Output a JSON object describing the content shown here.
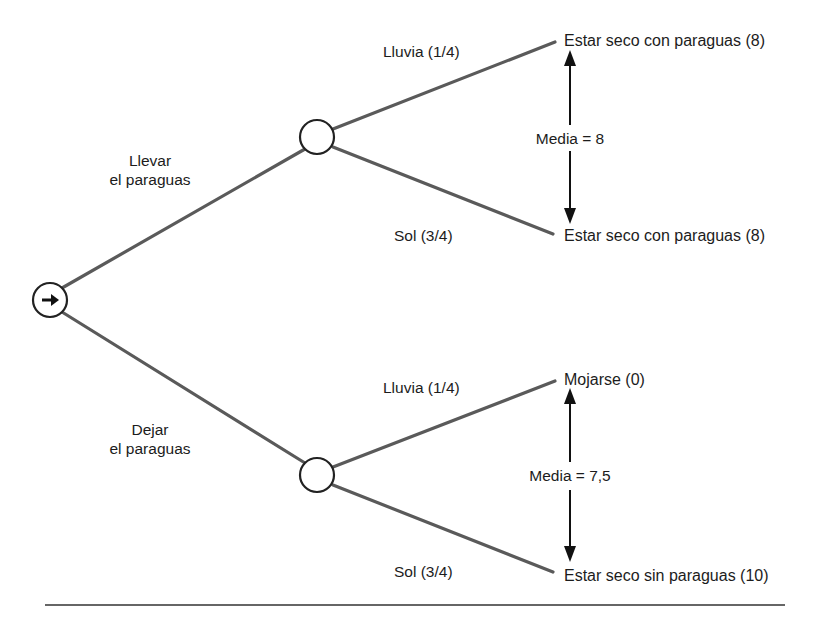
{
  "diagram": {
    "type": "decision-tree",
    "decision_node": {
      "icon": "arrow-right-icon"
    },
    "choices": [
      {
        "label_line1": "Llevar",
        "label_line2": "el paraguas",
        "mean_label": "Media = 8",
        "branches": [
          {
            "event": "Lluvia (1/4)",
            "outcome": "Estar seco con paraguas (8)"
          },
          {
            "event": "Sol (3/4)",
            "outcome": "Estar seco con paraguas (8)"
          }
        ]
      },
      {
        "label_line1": "Dejar",
        "label_line2": "el paraguas",
        "mean_label": "Media = 7,5",
        "branches": [
          {
            "event": "Lluvia (1/4)",
            "outcome": "Mojarse  (0)"
          },
          {
            "event": "Sol (3/4)",
            "outcome": "Estar seco sin paraguas (10)"
          }
        ]
      }
    ]
  },
  "colors": {
    "branch_line": "#555555",
    "node_stroke": "#222222",
    "text": "#1c1c1c",
    "rule": "#333333"
  }
}
